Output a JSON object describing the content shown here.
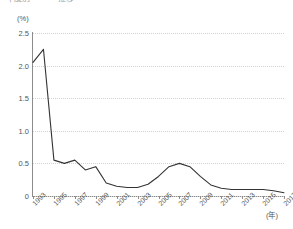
{
  "title": "年度別 ・・・推移",
  "axes": {
    "y_unit": "(%)",
    "x_unit": "(年)",
    "y_ticks": [
      "0",
      "0.5",
      "1.0",
      "1.5",
      "2.0",
      "2.5"
    ],
    "x_ticks": [
      "1993",
      "1995",
      "1997",
      "1999",
      "2001",
      "2003",
      "2005",
      "2007",
      "2009",
      "2011",
      "2013",
      "2015",
      "2017"
    ]
  },
  "style": {
    "line_color": "#333333",
    "grid_color": "#d2d2d2",
    "axis_color": "#8c8c8c",
    "background": "#ffffff"
  },
  "chart_data": {
    "type": "line",
    "title": "年度別 ・・・推移",
    "xlabel": "(年)",
    "ylabel": "(%)",
    "xlim": [
      1993,
      2017
    ],
    "ylim": [
      0,
      2.5
    ],
    "grid": true,
    "legend": "none",
    "x": [
      1993,
      1994,
      1995,
      1996,
      1997,
      1998,
      1999,
      2000,
      2001,
      2002,
      2003,
      2004,
      2005,
      2006,
      2007,
      2008,
      2009,
      2010,
      2011,
      2012,
      2013,
      2014,
      2015,
      2016,
      2017
    ],
    "categories": [
      "1993",
      "1994",
      "1995",
      "1996",
      "1997",
      "1998",
      "1999",
      "2000",
      "2001",
      "2002",
      "2003",
      "2004",
      "2005",
      "2006",
      "2007",
      "2008",
      "2009",
      "2010",
      "2011",
      "2012",
      "2013",
      "2014",
      "2015",
      "2016",
      "2017"
    ],
    "values": [
      2.05,
      2.25,
      0.55,
      0.5,
      0.55,
      0.4,
      0.45,
      0.2,
      0.15,
      0.13,
      0.13,
      0.18,
      0.3,
      0.45,
      0.5,
      0.45,
      0.3,
      0.17,
      0.12,
      0.1,
      0.1,
      0.1,
      0.1,
      0.08,
      0.05
    ],
    "series": [
      {
        "name": "割合",
        "values": [
          2.05,
          2.25,
          0.55,
          0.5,
          0.55,
          0.4,
          0.45,
          0.2,
          0.15,
          0.13,
          0.13,
          0.18,
          0.3,
          0.45,
          0.5,
          0.45,
          0.3,
          0.17,
          0.12,
          0.1,
          0.1,
          0.1,
          0.1,
          0.08,
          0.05
        ]
      }
    ]
  }
}
